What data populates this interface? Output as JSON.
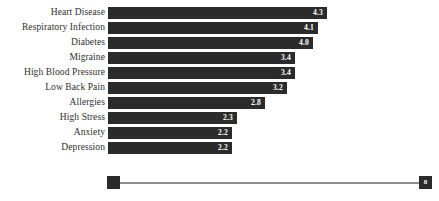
{
  "chart_data": {
    "type": "bar",
    "orientation": "horizontal",
    "title": "",
    "subtitle": "",
    "xlabel": "",
    "ylabel": "",
    "grid": false,
    "legend": null,
    "xlim": [
      0,
      4.8
    ],
    "categories": [
      "Heart Disease",
      "Respiratory Infection",
      "Diabetes",
      "Migraine",
      "High Blood Pressure",
      "Low Back Pain",
      "Allergies",
      "High Stress",
      "Anxiety",
      "Depression"
    ],
    "values": [
      4.3,
      4.1,
      4.0,
      3.4,
      3.4,
      3.2,
      2.8,
      2.3,
      2.2,
      2.2
    ],
    "value_labels": [
      "4.3",
      "4.1",
      "4.0",
      "3.4",
      "3.4",
      "3.2",
      "2.8",
      "2.3",
      "2.2",
      "2.2"
    ],
    "bar_pixel_widths": [
      219,
      210,
      205,
      187,
      187,
      179,
      157,
      129,
      124,
      124
    ],
    "bar_color": "#2b2b2b",
    "value_label_color": "#ffffff",
    "category_label_color": "#2e2e2e",
    "background_color": "#ffffff"
  },
  "range_slider": {
    "left_handle_label": "",
    "right_handle_label": "8",
    "track_color": "#8c8c8c",
    "handle_color": "#2b2b2b"
  }
}
